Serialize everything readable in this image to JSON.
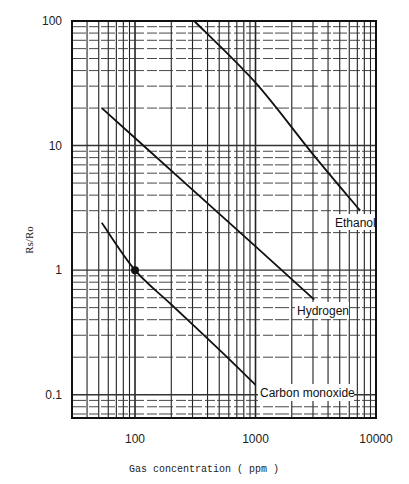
{
  "chart_data": {
    "type": "line",
    "title": "",
    "xlabel": "Gas concentration ( ppm )",
    "ylabel": "Rs/Ro",
    "xscale": "log",
    "yscale": "log",
    "xlim": [
      30,
      10000
    ],
    "ylim": [
      0.065,
      100
    ],
    "x_tick_labels": [
      "100",
      "1000",
      "10000"
    ],
    "x_ticks": [
      100,
      1000,
      10000
    ],
    "y_tick_labels": [
      "100",
      "10",
      "1",
      "0.1"
    ],
    "y_ticks": [
      100,
      10,
      1,
      0.1
    ],
    "grid": true,
    "legend": "inline labels at line ends",
    "series": [
      {
        "name": "Ethanol",
        "points": [
          [
            310,
            100
          ],
          [
            1000,
            32
          ],
          [
            3000,
            8.5
          ],
          [
            7400,
            3.0
          ]
        ]
      },
      {
        "name": "Hydrogen",
        "points": [
          [
            53,
            20
          ],
          [
            100,
            11.5
          ],
          [
            1000,
            1.55
          ],
          [
            3070,
            0.58
          ]
        ]
      },
      {
        "name": "Carbon monoxide",
        "points": [
          [
            53,
            2.4
          ],
          [
            100,
            1.0
          ],
          [
            200,
            0.53
          ],
          [
            500,
            0.23
          ],
          [
            1000,
            0.12
          ]
        ]
      }
    ],
    "annotations": [
      {
        "type": "marker",
        "series": "Carbon monoxide",
        "x": 100,
        "y": 1.0,
        "shape": "filled-circle"
      }
    ]
  },
  "axis": {
    "xlabel": "Gas concentration ( ppm )",
    "ylabel": "Rs/Ro",
    "x_ticks": [
      "100",
      "1000",
      "10000"
    ],
    "y_ticks": [
      "100",
      "10",
      "1",
      "0.1"
    ]
  },
  "labels": {
    "ethanol": "Ethanol",
    "hydrogen": "Hydrogen",
    "carbon_monoxide": "Carbon monoxide"
  },
  "colors": {
    "line": "#111111",
    "grid": "#222222",
    "background": "#ffffff"
  }
}
